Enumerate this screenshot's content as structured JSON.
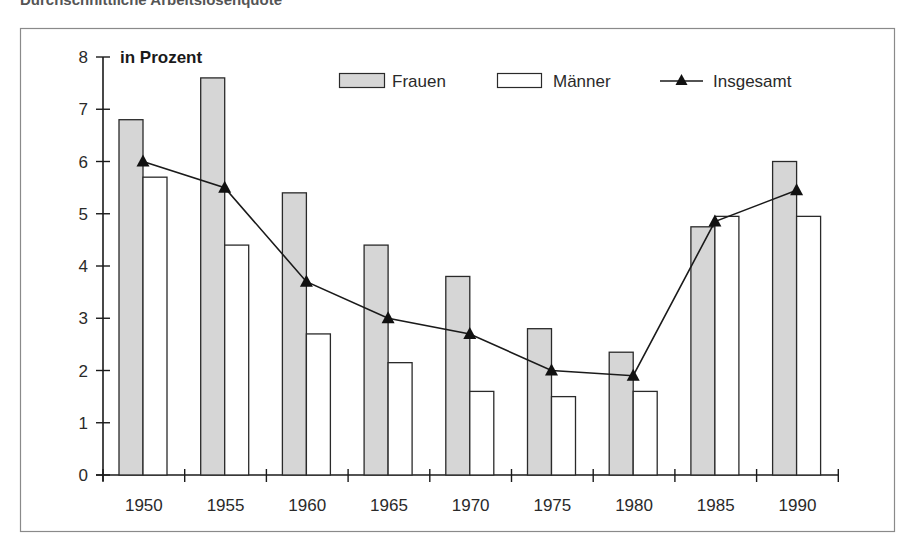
{
  "header": {
    "cut_off_title": "Durchschnittliche Arbeitslosenquote"
  },
  "colors": {
    "frauen_fill": "#d6d6d6",
    "maenner_fill": "#ffffff",
    "bar_stroke": "#2a2a2a",
    "line": "#1a1a1a",
    "frame": "#8a8a8a"
  },
  "chart_data": {
    "type": "bar",
    "title": "",
    "unit_label": "in Prozent",
    "xlabel": "",
    "ylabel": "in Prozent",
    "ylim": [
      0,
      8
    ],
    "yticks": [
      0,
      1,
      2,
      3,
      4,
      5,
      6,
      7,
      8
    ],
    "grid": false,
    "legend_position": "top-right",
    "categories": [
      "1950",
      "1955",
      "1960",
      "1965",
      "1970",
      "1975",
      "1980",
      "1985",
      "1990"
    ],
    "series": [
      {
        "name": "Frauen",
        "type": "bar",
        "values": [
          6.8,
          7.6,
          5.4,
          4.4,
          3.8,
          2.8,
          2.35,
          4.75,
          6.0
        ]
      },
      {
        "name": "Männer",
        "type": "bar",
        "values": [
          5.7,
          4.4,
          2.7,
          2.15,
          1.6,
          1.5,
          1.6,
          4.95,
          4.95
        ]
      },
      {
        "name": "Insgesamt",
        "type": "line",
        "marker": "triangle",
        "values": [
          6.0,
          5.5,
          3.7,
          3.0,
          2.7,
          2.0,
          1.9,
          4.85,
          5.45
        ]
      }
    ]
  },
  "legend": {
    "items": [
      {
        "label": "Frauen",
        "swatch": "bar-gray"
      },
      {
        "label": "Männer",
        "swatch": "bar-white"
      },
      {
        "label": "Insgesamt",
        "swatch": "line-triangle"
      }
    ]
  }
}
